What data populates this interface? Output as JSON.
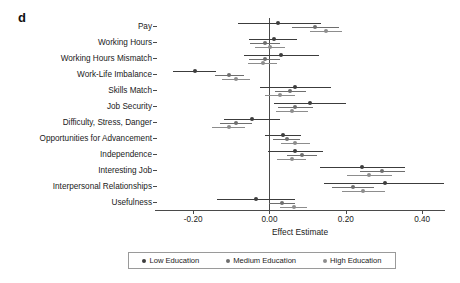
{
  "panel": {
    "letter": "d"
  },
  "legend": {
    "position": "bottom",
    "items": [
      {
        "label": "Low Education",
        "color": "#3d3d3d",
        "key": "low"
      },
      {
        "label": "Medium Education",
        "color": "#6e6e6e",
        "key": "medium"
      },
      {
        "label": "High Education",
        "color": "#8d8d8d",
        "key": "high"
      }
    ]
  },
  "axis": {
    "xlabel": "Effect Estimate",
    "ticks": [
      {
        "value": -0.2,
        "label": "-0.20"
      },
      {
        "value": 0.0,
        "label": "0.00"
      },
      {
        "value": 0.2,
        "label": "0.20"
      },
      {
        "value": 0.4,
        "label": "0.40"
      }
    ],
    "xlim": [
      -0.3,
      0.46
    ]
  },
  "chart_data": {
    "type": "scatter",
    "title": "",
    "subtitle": "",
    "xlabel": "Effect Estimate",
    "ylabel": "",
    "xlim": [
      -0.3,
      0.46
    ],
    "grid": false,
    "legend_position": "bottom",
    "reference_line": 0.0,
    "categories": [
      "Pay",
      "Working Hours",
      "Working Hours Mismatch",
      "Work-Life Imbalance",
      "Skills Match",
      "Job Security",
      "Difficulty, Stress, Danger",
      "Opportunities for Advancement",
      "Independence",
      "Interesting Job",
      "Interpersonal Relationships",
      "Usefulness"
    ],
    "series": [
      {
        "name": "Low Education",
        "key": "low",
        "color": "#3d3d3d",
        "estimates": [
          0.022,
          0.011,
          0.031,
          -0.196,
          0.068,
          0.106,
          -0.045,
          0.035,
          0.068,
          0.243,
          0.302,
          -0.035
        ],
        "ci_low": [
          -0.083,
          -0.053,
          -0.067,
          -0.252,
          -0.026,
          0.012,
          -0.12,
          -0.011,
          -0.005,
          0.132,
          0.143,
          -0.137
        ],
        "ci_high": [
          0.134,
          0.072,
          0.13,
          -0.14,
          0.162,
          0.2,
          0.028,
          0.082,
          0.141,
          0.355,
          0.458,
          0.067
        ]
      },
      {
        "name": "Medium Education",
        "key": "medium",
        "color": "#6e6e6e",
        "estimates": [
          0.12,
          -0.012,
          -0.013,
          -0.106,
          0.055,
          0.068,
          -0.088,
          0.045,
          0.085,
          0.296,
          0.219,
          0.032
        ]
      },
      {
        "name": "High Education",
        "key": "high",
        "color": "#8d8d8d",
        "estimates": [
          0.148,
          0.002,
          -0.018,
          -0.087,
          0.028,
          0.059,
          -0.107,
          0.068,
          0.058,
          0.262,
          0.246,
          0.063
        ]
      }
    ],
    "series_ci": {
      "medium": {
        "ci_low": [
          0.059,
          -0.051,
          -0.054,
          -0.144,
          0.014,
          0.022,
          -0.13,
          0.009,
          0.046,
          0.238,
          0.165,
          -0.002
        ],
        "ci_high": [
          0.181,
          0.027,
          0.028,
          -0.068,
          0.096,
          0.114,
          -0.046,
          0.081,
          0.124,
          0.354,
          0.273,
          0.066
        ]
      },
      "high": {
        "ci_low": [
          0.105,
          -0.038,
          -0.056,
          -0.124,
          -0.011,
          0.016,
          -0.15,
          0.03,
          0.02,
          0.203,
          0.19,
          0.027
        ],
        "ci_high": [
          0.191,
          0.042,
          0.02,
          -0.05,
          0.067,
          0.102,
          -0.064,
          0.106,
          0.096,
          0.321,
          0.302,
          0.099
        ]
      }
    }
  }
}
